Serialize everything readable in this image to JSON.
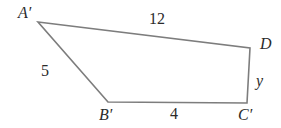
{
  "figure": {
    "kind": "quadrilateral-diagram",
    "stroke_color": "#7d7d7d",
    "text_color": "#2b2b2b",
    "background_color": "#ffffff",
    "stroke_width": 1.6
  },
  "vertices": [
    {
      "id": "A",
      "label": "A′",
      "x": 38,
      "y": 22
    },
    {
      "id": "D",
      "label": "D",
      "x": 250,
      "y": 48
    },
    {
      "id": "C",
      "label": "C′",
      "x": 247,
      "y": 103
    },
    {
      "id": "B",
      "label": "B′",
      "x": 108,
      "y": 102
    }
  ],
  "side_labels": [
    {
      "id": "top",
      "between": "A′D",
      "text": "12"
    },
    {
      "id": "left",
      "between": "A′B′",
      "text": "5"
    },
    {
      "id": "bottom",
      "between": "B′C′",
      "text": "4"
    },
    {
      "id": "right",
      "between": "DC′",
      "text": "y"
    }
  ],
  "polygon_points": "38,22 250,48 247,103 108,102"
}
